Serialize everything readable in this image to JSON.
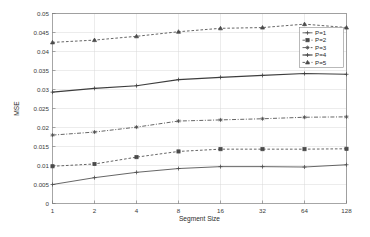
{
  "chart_data": {
    "type": "line",
    "title": "",
    "xlabel": "Segment Size",
    "ylabel": "MSE",
    "x": [
      1,
      2,
      4,
      8,
      16,
      32,
      64,
      128
    ],
    "x_tick_labels": [
      "1",
      "2",
      "4",
      "8",
      "16",
      "32",
      "64",
      "128"
    ],
    "x_scale": "log2",
    "xlim": [
      1,
      128
    ],
    "ylim": [
      0,
      0.05
    ],
    "y_ticks": [
      0,
      0.005,
      0.01,
      0.015,
      0.02,
      0.025,
      0.03,
      0.035,
      0.04,
      0.045,
      0.05
    ],
    "y_tick_labels": [
      "0",
      "0.005",
      "0.01",
      "0.015",
      "0.02",
      "0.025",
      "0.03",
      "0.035",
      "0.04",
      "0.045",
      "0.05"
    ],
    "grid": true,
    "legend_position": "upper right",
    "series": [
      {
        "name": "P=1",
        "values": [
          0.005,
          0.0068,
          0.0082,
          0.0092,
          0.0097,
          0.0097,
          0.0096,
          0.0102
        ],
        "style": "solid",
        "marker": "plus",
        "color": "#4a4a4a"
      },
      {
        "name": "P=2",
        "values": [
          0.0098,
          0.0104,
          0.0122,
          0.0137,
          0.0143,
          0.0143,
          0.0143,
          0.0144
        ],
        "style": "dashed",
        "marker": "square",
        "color": "#4a4a4a"
      },
      {
        "name": "P=3",
        "values": [
          0.018,
          0.0188,
          0.0201,
          0.0217,
          0.022,
          0.0223,
          0.0227,
          0.0228
        ],
        "style": "dashdot",
        "marker": "asterisk",
        "color": "#4a4a4a"
      },
      {
        "name": "P=4",
        "values": [
          0.0293,
          0.0303,
          0.031,
          0.0326,
          0.0332,
          0.0337,
          0.0342,
          0.034
        ],
        "style": "solid",
        "marker": "plus",
        "color": "#3d3d3d"
      },
      {
        "name": "P=5",
        "values": [
          0.0424,
          0.043,
          0.044,
          0.0452,
          0.0461,
          0.0463,
          0.0472,
          0.0463
        ],
        "style": "dashed",
        "marker": "triangle",
        "color": "#4a4a4a"
      }
    ]
  }
}
